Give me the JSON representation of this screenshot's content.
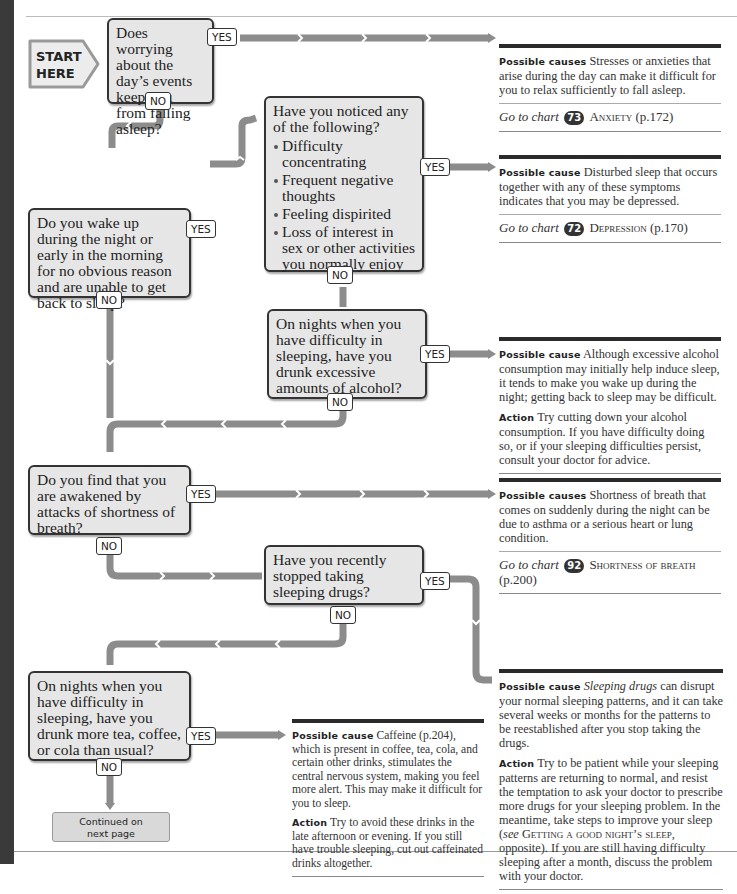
{
  "start": {
    "line1": "START",
    "line2": "HERE"
  },
  "labels": {
    "yes": "YES",
    "no": "NO"
  },
  "questions": [
    {
      "text": "Does worrying about the day’s events keep you from falling asleep?"
    },
    {
      "text": "Have you noticed any of the following?",
      "bullets": [
        "Difficulty concentrating",
        "Frequent negative thoughts",
        "Feeling dispirited",
        "Loss of interest in sex or other activities you normally enjoy"
      ]
    },
    {
      "text": "Do you wake up during the night or early in the morning for no obvious reason and are unable to get back to sleep?"
    },
    {
      "text": "On nights when you have difficulty in sleeping, have you drunk excessive amounts of alcohol?"
    },
    {
      "text": "Do you find that you are awakened by attacks of shortness of breath?"
    },
    {
      "text": "Have you recently stopped taking sleeping drugs?"
    },
    {
      "text": "On nights when you have difficulty in sleeping, have you drunk more tea, coffee, or cola than usual?"
    }
  ],
  "results": [
    {
      "heading": "Possible causes",
      "text": "Stresses or anxieties that arise during the day can make it difficult for you to relax sufficiently to fall asleep.",
      "goto_prefix": "Go to chart",
      "chart_num": "73",
      "chart_name": "Anxiety",
      "page": "(p.172)"
    },
    {
      "heading": "Possible cause",
      "text": "Disturbed sleep that occurs together with any of these symptoms indicates that you may be depressed.",
      "goto_prefix": "Go to chart",
      "chart_num": "72",
      "chart_name": "Depression",
      "page": "(p.170)"
    },
    {
      "heading": "Possible cause",
      "text": "Although excessive alcohol consumption may initially help induce sleep, it tends to make you wake up during the night; getting back to sleep may be difficult.",
      "action_heading": "Action",
      "action": "Try cutting down your alcohol consumption. If you have difficulty doing so, or if your sleeping difficulties persist, consult your doctor for advice."
    },
    {
      "heading": "Possible causes",
      "text": "Shortness of breath that comes on suddenly during the night can be due to asthma or a serious heart or lung condition.",
      "goto_prefix": "Go to chart",
      "chart_num": "92",
      "chart_name": "Shortness of breath",
      "page": "(p.200)"
    },
    {
      "heading": "Possible cause",
      "text_em": "Sleeping drugs",
      "text": "can disrupt your normal sleeping patterns, and it can take several weeks or months for the patterns to be reestablished after you stop taking the drugs.",
      "action_heading": "Action",
      "action_a": "Try to be patient while your sleeping patterns are returning to normal, and resist the temptation to ask your doctor to prescribe more drugs for your sleeping problem. In the meantime, take steps to improve your sleep (",
      "action_see": "see",
      "action_ref": "Getting a good night’s sleep",
      "action_b": ", opposite). If you are still having difficulty sleeping after a month, discuss the problem with your doctor."
    },
    {
      "heading": "Possible cause",
      "text": "Caffeine (p.204), which is present in coffee, tea, cola, and certain other drinks, stimulates the central nervous system, making you feel more alert. This may make it difficult for you to sleep.",
      "action_heading": "Action",
      "action": "Try to avoid these drinks in the late afternoon or evening. If you still have trouble sleeping, cut out caffeinated drinks altogether."
    }
  ],
  "continued": {
    "line1": "Continued on",
    "line2": "next page"
  },
  "colors": {
    "connector": "#8c8c8c",
    "box_fill": "#e6e6e6",
    "box_border": "#333333",
    "rule": "#2a2a2a"
  }
}
